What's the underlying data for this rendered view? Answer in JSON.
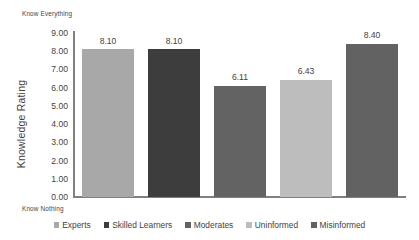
{
  "chart_data": {
    "type": "bar",
    "title": "",
    "xlabel": "",
    "ylabel": "Knowledge Rating",
    "categories": [
      "Experts",
      "Skilled Learners",
      "Moderates",
      "Uninformed",
      "Misinformed"
    ],
    "values": [
      8.1,
      8.1,
      6.11,
      6.43,
      8.4
    ],
    "value_labels": [
      "8.10",
      "8.10",
      "6.11",
      "6.43",
      "8.40"
    ],
    "series": [
      {
        "name": "Knowledge Rating",
        "values": [
          8.1,
          8.1,
          6.11,
          6.43,
          8.4
        ]
      }
    ],
    "bar_colors": [
      "#a8a8a8",
      "#3d3d3d",
      "#636363",
      "#bdbdbd",
      "#626262"
    ],
    "ylim": [
      0,
      9
    ],
    "ytick_labels": [
      "0.00",
      "1.00",
      "2.00",
      "3.00",
      "4.00",
      "5.00",
      "6.00",
      "7.00",
      "8.00",
      "9.00"
    ],
    "ytick_values": [
      0,
      1,
      2,
      3,
      4,
      5,
      6,
      7,
      8,
      9
    ],
    "grid": false,
    "legend_position": "bottom",
    "axis_color": "#808080",
    "text_color": "#3f3f3f",
    "background": "#ffffff",
    "scale_anchor_high": "Know Everything",
    "scale_anchor_low": "Know Nothing"
  },
  "axis": {
    "y_title": "Knowledge Rating",
    "anchor_high": "Know Everything",
    "anchor_low": "Know Nothing"
  },
  "legend": {
    "items": [
      {
        "label": "Experts",
        "color": "#a8a8a8"
      },
      {
        "label": "Skilled Learners",
        "color": "#3d3d3d"
      },
      {
        "label": "Moderates",
        "color": "#636363"
      },
      {
        "label": "Uninformed",
        "color": "#bdbdbd"
      },
      {
        "label": "Misinformed",
        "color": "#626262"
      }
    ]
  }
}
